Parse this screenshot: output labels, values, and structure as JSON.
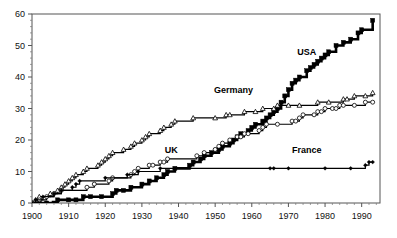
{
  "chart_data": {
    "type": "line",
    "title": "",
    "subtitle": "",
    "xlabel": "",
    "ylabel": "",
    "xlim": [
      1900,
      1995
    ],
    "ylim": [
      0,
      60
    ],
    "grid": false,
    "legend_position": "inline-annotations",
    "xticks": [
      1900,
      1910,
      1920,
      1930,
      1940,
      1950,
      1960,
      1970,
      1980,
      1990
    ],
    "xtick_labels": [
      "1900",
      "1910",
      "1920",
      "1930",
      "1940",
      "1950",
      "1960",
      "1970",
      "1980",
      "1990"
    ],
    "yticks": [
      0,
      10,
      20,
      30,
      40,
      50,
      60
    ],
    "ytick_labels": [
      "0",
      "10",
      "20",
      "30",
      "40",
      "50",
      "60"
    ],
    "annotations": [
      {
        "text": "USA",
        "x": 1975,
        "y": 47
      },
      {
        "text": "Germany",
        "x": 1955,
        "y": 35
      },
      {
        "text": "UK",
        "x": 1938,
        "y": 16
      },
      {
        "text": "France",
        "x": 1975,
        "y": 16
      }
    ],
    "series": [
      {
        "name": "USA",
        "marker": "filled-square",
        "color": "#000000",
        "x": [
          1900,
          1902,
          1904,
          1906,
          1907,
          1910,
          1912,
          1914,
          1916,
          1919,
          1922,
          1923,
          1925,
          1927,
          1930,
          1932,
          1934,
          1936,
          1937,
          1939,
          1943,
          1944,
          1946,
          1202,
          1947,
          1949,
          1951,
          1952,
          1954,
          1955,
          1956,
          1957,
          1959,
          1960,
          1961,
          1963,
          1964,
          1965,
          1966,
          1967,
          1968,
          1969,
          1970,
          1971,
          1972,
          1973,
          1975,
          1976,
          1977,
          1978,
          1979,
          1980,
          1981,
          1983,
          1985,
          1987,
          1989,
          1990,
          1993
        ],
        "values": [
          0,
          0,
          0,
          0,
          1,
          1,
          1,
          2,
          2,
          2,
          3,
          4,
          4,
          5,
          6,
          7,
          8,
          9,
          10,
          11,
          12,
          13,
          14,
          14,
          15,
          16,
          17,
          18,
          19,
          20,
          21,
          22,
          23,
          24,
          25,
          26,
          27,
          28,
          29,
          30,
          32,
          34,
          36,
          38,
          39,
          40,
          42,
          43,
          44,
          45,
          46,
          47,
          48,
          50,
          51,
          52,
          54,
          55,
          58
        ]
      },
      {
        "name": "Germany",
        "marker": "open-triangle",
        "color": "#000000",
        "x": [
          1900,
          1901,
          1902,
          1905,
          1907,
          1908,
          1909,
          1910,
          1911,
          1912,
          1914,
          1915,
          1918,
          1919,
          1920,
          1921,
          1922,
          1925,
          1927,
          1928,
          1930,
          1931,
          1932,
          1935,
          1936,
          1938,
          1939,
          1944,
          1950,
          1953,
          1954,
          1958,
          1961,
          1963,
          1966,
          1967,
          1970,
          1973,
          1978,
          1981,
          1985,
          1986,
          1988,
          1991,
          1993
        ],
        "values": [
          0,
          1,
          2,
          3,
          4,
          5,
          6,
          7,
          8,
          9,
          10,
          11,
          12,
          13,
          14,
          15,
          16,
          17,
          18,
          19,
          20,
          21,
          22,
          23,
          24,
          25,
          26,
          27,
          27,
          28,
          28,
          29,
          29,
          30,
          30,
          31,
          31,
          31,
          32,
          32,
          33,
          33,
          34,
          34,
          35
        ]
      },
      {
        "name": "UK",
        "marker": "open-circle",
        "color": "#000000",
        "x": [
          1900,
          1902,
          1904,
          1906,
          1908,
          1915,
          1917,
          1921,
          1922,
          1927,
          1928,
          1929,
          1932,
          1933,
          1935,
          1936,
          1937,
          1945,
          1947,
          1950,
          1951,
          1952,
          1954,
          1956,
          1957,
          1958,
          1959,
          1962,
          1963,
          1964,
          1967,
          1971,
          1972,
          1973,
          1974,
          1977,
          1978,
          1979,
          1980,
          1982,
          1983,
          1984,
          1985,
          1988,
          1991,
          1993
        ],
        "values": [
          0,
          1,
          2,
          3,
          4,
          5,
          6,
          7,
          8,
          9,
          10,
          11,
          12,
          12,
          13,
          13,
          14,
          15,
          16,
          17,
          18,
          19,
          20,
          21,
          21,
          22,
          22,
          23,
          24,
          25,
          25,
          26,
          26,
          27,
          28,
          28,
          29,
          29,
          30,
          30,
          30,
          31,
          31,
          31,
          32,
          32
        ]
      },
      {
        "name": "France",
        "marker": "filled-diamond",
        "color": "#000000",
        "x": [
          1900,
          1901,
          1903,
          1906,
          1908,
          1911,
          1912,
          1913,
          1920,
          1926,
          1929,
          1935,
          1965,
          1966,
          1970,
          1980,
          1987,
          1991,
          1992,
          1993
        ],
        "values": [
          0,
          1,
          2,
          3,
          4,
          5,
          6,
          7,
          8,
          9,
          10,
          11,
          11,
          11,
          11,
          11,
          11,
          12,
          13,
          13
        ]
      }
    ]
  },
  "axes": {
    "y_axis_name": "y-axis",
    "x_axis_name": "x-axis"
  }
}
